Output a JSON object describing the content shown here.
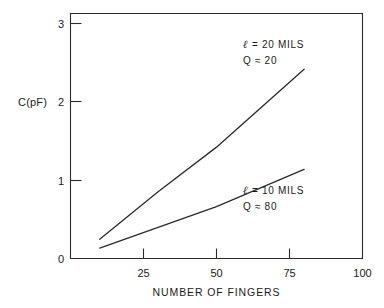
{
  "figure": {
    "background_color": "#ffffff",
    "ink_color": "#2b2b2b"
  },
  "chart_data": {
    "type": "line",
    "title": "",
    "subtitle": "",
    "xlabel": "NUMBER OF FINGERS",
    "ylabel": "C(pF)",
    "xlim": [
      0,
      100
    ],
    "ylim": [
      0,
      3.3
    ],
    "xticks": [
      25,
      50,
      75,
      100
    ],
    "xtick_labels": [
      "25",
      "50",
      "75",
      "100"
    ],
    "yticks": [
      0,
      1,
      2,
      3
    ],
    "ytick_labels": [
      "0",
      "1",
      "2",
      "3"
    ],
    "grid": false,
    "legend": "none",
    "axis_style": "box-frame-with-inward-ticks",
    "series": [
      {
        "name": "l = 20 MILS, Q ~ 20",
        "x": [
          10,
          30,
          50,
          80
        ],
        "values": [
          0.26,
          0.9,
          1.5,
          2.55
        ],
        "annotation_line1": "ℓ = 20 MILS",
        "annotation_line2": "Q ≈ 20"
      },
      {
        "name": "l = 10 MILS, Q ~ 80",
        "x": [
          10,
          30,
          50,
          80
        ],
        "values": [
          0.14,
          0.42,
          0.7,
          1.2
        ],
        "annotation_line1": "ℓ = 10 MILS",
        "annotation_line2": "Q ≈ 80"
      }
    ]
  },
  "annotations": {
    "upper": {
      "symbol": "ℓ",
      "line1_rest": "= 20 MILS",
      "line2": "Q ≈ 20",
      "line1_full": "ℓ = 20 MILS"
    },
    "lower": {
      "symbol": "ℓ",
      "line1_rest": "= 10 MILS",
      "line2": "Q ≈ 80",
      "line1_full": "ℓ = 10 MILS"
    }
  },
  "axes": {
    "y_title": "C(pF)",
    "x_title": "NUMBER OF FINGERS",
    "x_tick_0": "25",
    "x_tick_1": "50",
    "x_tick_2": "75",
    "x_tick_3": "100",
    "y_tick_0": "0",
    "y_tick_1": "1",
    "y_tick_2": "2",
    "y_tick_3": "3"
  }
}
